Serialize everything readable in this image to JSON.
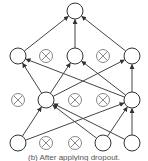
{
  "diagram": {
    "caption": "(b) After applying dropout.",
    "colors": {
      "stroke": "#333333",
      "dropped_fill": "#ffffff",
      "dropped_stroke": "#888888",
      "edge": "#444444"
    },
    "node_radius": 8,
    "nodes": [
      {
        "id": "o1",
        "x": 75,
        "y": 11,
        "dropped": false
      },
      {
        "id": "h2a",
        "x": 18,
        "y": 56,
        "dropped": false
      },
      {
        "id": "h2b",
        "x": 46,
        "y": 56,
        "dropped": true
      },
      {
        "id": "h2c",
        "x": 75,
        "y": 56,
        "dropped": false
      },
      {
        "id": "h2d",
        "x": 103,
        "y": 56,
        "dropped": true
      },
      {
        "id": "h2e",
        "x": 132,
        "y": 56,
        "dropped": false
      },
      {
        "id": "h1a",
        "x": 18,
        "y": 100,
        "dropped": true
      },
      {
        "id": "h1b",
        "x": 46,
        "y": 100,
        "dropped": false
      },
      {
        "id": "h1c",
        "x": 75,
        "y": 100,
        "dropped": true
      },
      {
        "id": "h1d",
        "x": 103,
        "y": 100,
        "dropped": true
      },
      {
        "id": "h1e",
        "x": 132,
        "y": 100,
        "dropped": false
      },
      {
        "id": "i1",
        "x": 18,
        "y": 143,
        "dropped": false
      },
      {
        "id": "i2",
        "x": 46,
        "y": 143,
        "dropped": true
      },
      {
        "id": "i3",
        "x": 75,
        "y": 143,
        "dropped": true
      },
      {
        "id": "i4",
        "x": 103,
        "y": 143,
        "dropped": false
      },
      {
        "id": "i5",
        "x": 132,
        "y": 143,
        "dropped": false
      }
    ],
    "edges": [
      [
        "h2a",
        "o1"
      ],
      [
        "h2c",
        "o1"
      ],
      [
        "h2e",
        "o1"
      ],
      [
        "h1b",
        "h2a"
      ],
      [
        "h1b",
        "h2c"
      ],
      [
        "h1b",
        "h2e"
      ],
      [
        "h1e",
        "h2a"
      ],
      [
        "h1e",
        "h2c"
      ],
      [
        "h1e",
        "h2e"
      ],
      [
        "i1",
        "h1b"
      ],
      [
        "i1",
        "h1e"
      ],
      [
        "i4",
        "h1b"
      ],
      [
        "i4",
        "h1e"
      ],
      [
        "i5",
        "h1b"
      ],
      [
        "i5",
        "h1e"
      ]
    ]
  }
}
